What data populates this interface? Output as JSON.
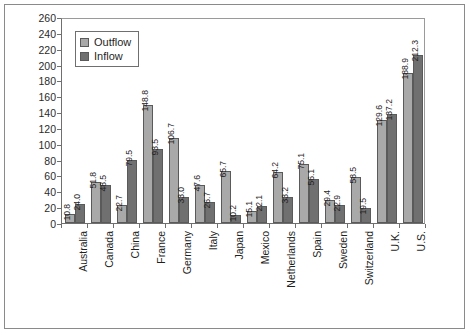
{
  "chart_data": {
    "type": "bar",
    "title": "",
    "subtitle": "",
    "xlabel": "",
    "ylabel": "",
    "ylim": [
      0,
      260
    ],
    "ytick_step": 20,
    "yticks": [
      0,
      20,
      40,
      60,
      80,
      100,
      120,
      140,
      160,
      180,
      200,
      220,
      240,
      260
    ],
    "grid": false,
    "legend_position": "upper-left-inside",
    "categories": [
      "Australia",
      "Canada",
      "China",
      "France",
      "Germany",
      "Italy",
      "Japan",
      "Mexico",
      "Netherlands",
      "Spain",
      "Sweden",
      "Switzerland",
      "U.K.",
      "U.S."
    ],
    "series": [
      {
        "name": "Outflow",
        "color": "#a9a9a9",
        "values": [
          10.8,
          51.8,
          22.7,
          148.8,
          106.7,
          47.6,
          65.7,
          15.1,
          64.2,
          75.1,
          29.4,
          58.5,
          129.6,
          188.9
        ],
        "labels": [
          "10.8",
          "51.8",
          "22.7",
          "148.8",
          "106.7",
          "47.6",
          "65.7",
          "15.1",
          "64.2",
          "75.1",
          "29.4",
          "58.5",
          "129.6",
          "188.9"
        ]
      },
      {
        "name": "Inflow",
        "color": "#707070",
        "values": [
          24.0,
          48.5,
          79.5,
          93.5,
          33.0,
          26.7,
          10.2,
          22.1,
          33.2,
          56.1,
          22.9,
          19.5,
          137.2,
          212.3
        ],
        "labels": [
          "24.0",
          "48.5",
          "79.5",
          "93.5",
          "33.0",
          "26.7",
          "10.2",
          "22.1",
          "33.2",
          "56.1",
          "22.9",
          "19.5",
          "137.2",
          "212.3"
        ]
      }
    ]
  },
  "legend": {
    "items": [
      {
        "label": "Outflow",
        "swatch": "outflow-swatch"
      },
      {
        "label": "Inflow",
        "swatch": "inflow-swatch"
      }
    ]
  }
}
